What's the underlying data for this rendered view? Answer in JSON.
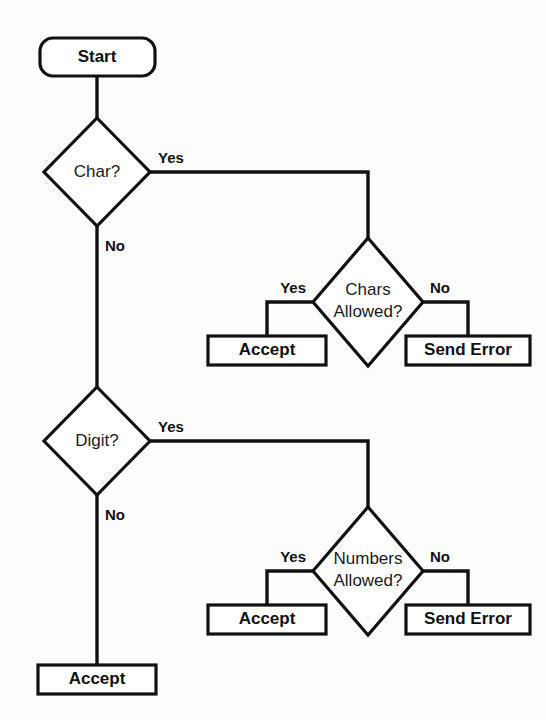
{
  "diagram": {
    "type": "flowchart",
    "colors": {
      "stroke": "#111111",
      "fill": "#ffffff",
      "background": "#fdfdfd"
    },
    "nodes": {
      "start": {
        "label": "Start",
        "shape": "rounded-rectangle",
        "weight": "bold"
      },
      "char_decision": {
        "label": "Char?",
        "shape": "diamond",
        "weight": "regular"
      },
      "chars_allowed_decision": {
        "label_line1": "Chars",
        "label_line2": "Allowed?",
        "shape": "diamond",
        "weight": "regular"
      },
      "accept_chars": {
        "label": "Accept",
        "shape": "rectangle",
        "weight": "bold"
      },
      "send_error_chars": {
        "label": "Send Error",
        "shape": "rectangle",
        "weight": "bold"
      },
      "digit_decision": {
        "label": "Digit?",
        "shape": "diamond",
        "weight": "regular"
      },
      "numbers_allowed_decision": {
        "label_line1": "Numbers",
        "label_line2": "Allowed?",
        "shape": "diamond",
        "weight": "regular"
      },
      "accept_numbers": {
        "label": "Accept",
        "shape": "rectangle",
        "weight": "bold"
      },
      "send_error_numbers": {
        "label": "Send Error",
        "shape": "rectangle",
        "weight": "bold"
      },
      "accept_final": {
        "label": "Accept",
        "shape": "rectangle",
        "weight": "bold"
      }
    },
    "edge_labels": {
      "char_yes": "Yes",
      "char_no": "No",
      "chars_allowed_yes": "Yes",
      "chars_allowed_no": "No",
      "digit_yes": "Yes",
      "digit_no": "No",
      "numbers_allowed_yes": "Yes",
      "numbers_allowed_no": "No"
    }
  }
}
